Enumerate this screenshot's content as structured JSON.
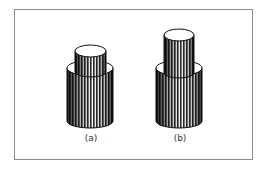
{
  "figure": {
    "panels": [
      {
        "label": "(a)",
        "description": "Short narrow cylinder seated inside a wider cylinder"
      },
      {
        "label": "(b)",
        "description": "Taller narrow cylinder protruding from a wider cylinder"
      }
    ]
  },
  "colors": {
    "frame": "#8a8a8a",
    "stroke": "#111111",
    "stripe_dark": "#222222",
    "stripe_light": "#ffffff"
  }
}
